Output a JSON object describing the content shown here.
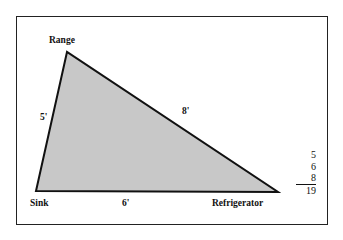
{
  "diagram": {
    "vertices": {
      "range": "Range",
      "sink": "Sink",
      "refrigerator": "Refrigerator"
    },
    "edges": {
      "range_sink": "5'",
      "range_refrigerator": "8'",
      "sink_refrigerator": "6'"
    },
    "sum": {
      "terms": [
        "5",
        "6",
        "8"
      ],
      "total": "19"
    },
    "colors": {
      "fill": "#c8c8c8",
      "stroke": "#111111"
    }
  }
}
